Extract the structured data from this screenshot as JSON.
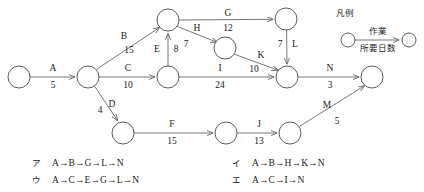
{
  "diagram": {
    "type": "arrow-diagram",
    "legend": {
      "title": "凡例",
      "activity_label": "作業",
      "duration_label": "所要日数"
    },
    "nodes": [
      {
        "id": "n1",
        "cx": 19,
        "cy": 77,
        "r": 11
      },
      {
        "id": "n2",
        "cx": 88,
        "cy": 77,
        "r": 11
      },
      {
        "id": "n3",
        "cx": 168,
        "cy": 20,
        "r": 11
      },
      {
        "id": "n4",
        "cx": 168,
        "cy": 77,
        "r": 11
      },
      {
        "id": "n5",
        "cx": 225,
        "cy": 48,
        "r": 11
      },
      {
        "id": "n6",
        "cx": 286,
        "cy": 19,
        "r": 11
      },
      {
        "id": "n7",
        "cx": 287,
        "cy": 77,
        "r": 11
      },
      {
        "id": "n8",
        "cx": 372,
        "cy": 77,
        "r": 11
      },
      {
        "id": "n9",
        "cx": 123,
        "cy": 133,
        "r": 11
      },
      {
        "id": "n10",
        "cx": 226,
        "cy": 133,
        "r": 11
      },
      {
        "id": "n11",
        "cx": 290,
        "cy": 133,
        "r": 11
      }
    ],
    "edges": [
      {
        "name": "A",
        "days": "5",
        "from": "n1",
        "to": "n2",
        "lx": 53,
        "ly": 71,
        "dx": 53,
        "dy": 88
      },
      {
        "name": "B",
        "days": "15",
        "from": "n2",
        "to": "n3",
        "lx": 124,
        "ly": 39,
        "dx": 129,
        "dy": 53
      },
      {
        "name": "C",
        "days": "10",
        "from": "n2",
        "to": "n4",
        "lx": 128,
        "ly": 71,
        "dx": 128,
        "dy": 88
      },
      {
        "name": "D",
        "days": "4",
        "from": "n2",
        "to": "n9",
        "lx": 112,
        "ly": 107,
        "dx": 100,
        "dy": 113
      },
      {
        "name": "E",
        "days": "8",
        "from": "n4",
        "to": "n3",
        "lx": 157,
        "ly": 52,
        "dx": 176,
        "dy": 52
      },
      {
        "name": "G",
        "days": "12",
        "from": "n3",
        "to": "n6",
        "lx": 228,
        "ly": 16,
        "dx": 228,
        "dy": 31
      },
      {
        "name": "H",
        "days": "7",
        "from": "n3",
        "to": "n5",
        "lx": 197,
        "ly": 31,
        "dx": 186,
        "dy": 47
      },
      {
        "name": "I",
        "days": "24",
        "from": "n4",
        "to": "n7",
        "lx": 220,
        "ly": 71,
        "dx": 220,
        "dy": 88
      },
      {
        "name": "K",
        "days": "10",
        "from": "n5",
        "to": "n7",
        "lx": 261,
        "ly": 58,
        "dx": 254,
        "dy": 72
      },
      {
        "name": "L",
        "days": "7",
        "from": "n6",
        "to": "n7",
        "lx": 295,
        "ly": 47,
        "dx": 280,
        "dy": 47
      },
      {
        "name": "F",
        "days": "15",
        "from": "n9",
        "to": "n10",
        "lx": 172,
        "ly": 127,
        "dx": 172,
        "dy": 144
      },
      {
        "name": "J",
        "days": "13",
        "from": "n10",
        "to": "n11",
        "lx": 259,
        "ly": 127,
        "dx": 259,
        "dy": 144
      },
      {
        "name": "M",
        "days": "5",
        "from": "n11",
        "to": "n8",
        "lx": 327,
        "ly": 108,
        "dx": 337,
        "dy": 124
      },
      {
        "name": "N",
        "days": "3",
        "from": "n7",
        "to": "n8",
        "lx": 330,
        "ly": 71,
        "dx": 330,
        "dy": 88
      }
    ]
  },
  "choices": [
    {
      "key": "ア",
      "text": "A→B→G→L→N",
      "x": 32,
      "y": 163
    },
    {
      "key": "イ",
      "text": "A→B→H→K→N",
      "x": 232,
      "y": 163
    },
    {
      "key": "ウ",
      "text": "A→C→E→G→L→N",
      "x": 32,
      "y": 180
    },
    {
      "key": "エ",
      "text": "A→C→I→N",
      "x": 232,
      "y": 180
    }
  ],
  "colors": {
    "stroke": "#6a6a6a",
    "node_stroke": "#4a4a4a",
    "text": "#1a1a1a",
    "background": "#ffffff"
  }
}
